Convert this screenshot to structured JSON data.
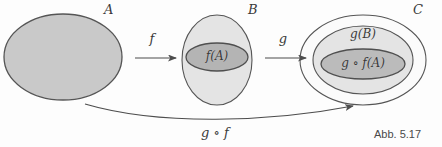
{
  "figure": {
    "caption": "Abb. 5.17",
    "background_color": "#fdfdfd",
    "stroke_color": "#5a5a5a"
  },
  "sets": {
    "a": {
      "label": "A",
      "fill_color": "#c9c9c9",
      "cx": 63,
      "cy": 57,
      "rx": 59,
      "ry": 43,
      "label_x": 104,
      "label_y": 3
    },
    "b": {
      "label": "B",
      "fill_color": "#e4e4e4",
      "cx": 217,
      "cy": 60,
      "rx": 35,
      "ry": 45,
      "label_x": 248,
      "label_y": 3
    },
    "c": {
      "label": "C",
      "fill_color": "#fbfbfb",
      "cx": 363,
      "cy": 60,
      "rx": 63,
      "ry": 45,
      "label_x": 413,
      "label_y": 3
    }
  },
  "regions": {
    "f_of_a": {
      "label": "f(A)",
      "fill_color": "#b4b4b4",
      "cx": 217,
      "cy": 57,
      "rx": 31,
      "ry": 14,
      "label_x": 217,
      "label_y": 50
    },
    "g_of_b": {
      "label": "g(B)",
      "fill_color": "#e4e4e4",
      "cx": 363,
      "cy": 60,
      "rx": 50,
      "ry": 34,
      "label_x": 363,
      "label_y": 28
    },
    "g_of_f_of_a": {
      "label": "g ∘ f(A)",
      "fill_color": "#bbbbbb",
      "cx": 363,
      "cy": 64,
      "rx": 42,
      "ry": 15,
      "label_x": 363,
      "label_y": 57
    }
  },
  "arrows": {
    "f": {
      "label": "f",
      "label_x": 152,
      "label_y": 32,
      "x1": 135,
      "y1": 58,
      "x2": 176,
      "y2": 58
    },
    "g": {
      "label": "g",
      "label_x": 283,
      "label_y": 32,
      "x1": 265,
      "y1": 58,
      "x2": 306,
      "y2": 58
    },
    "composition": {
      "label": "g ∘ f",
      "label_x": 215,
      "label_y": 126,
      "path": "M 85,104 C 160,126 270,122 353,106"
    }
  }
}
